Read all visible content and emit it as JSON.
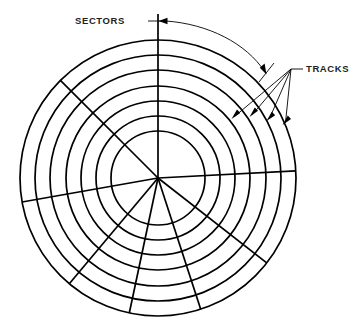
{
  "diagram": {
    "type": "technical-line-diagram",
    "background_color": "#ffffff",
    "line_color": "#000000",
    "text_color": "#231f20",
    "canvas": {
      "width": 354,
      "height": 327
    },
    "geometry": {
      "center": {
        "x": 158,
        "y": 178
      },
      "outer_radius": 138,
      "inner_radius": 47,
      "track_count": 7,
      "track_radii": [
        138,
        123,
        108,
        92,
        77,
        62,
        47
      ]
    },
    "sector_lines_deg": [
      90,
      135,
      190,
      230,
      258,
      288,
      322,
      357
    ],
    "callouts": [
      {
        "id": "sectors",
        "label": "SECTORS",
        "text_x": 100,
        "text_y": 24,
        "leader_from_x": 152,
        "leader_from_y": 21,
        "leader_to_x": 165,
        "leader_to_y": 21
      },
      {
        "id": "tracks",
        "label": "TRACKS",
        "text_x": 305,
        "text_y": 71,
        "leader_from_x": 296,
        "leader_from_y": 69,
        "arrow_count": 4
      }
    ],
    "track_arrow_targets": [
      {
        "x": 232,
        "y": 118
      },
      {
        "x": 250,
        "y": 116
      },
      {
        "x": 267,
        "y": 120
      },
      {
        "x": 283,
        "y": 124
      }
    ]
  }
}
